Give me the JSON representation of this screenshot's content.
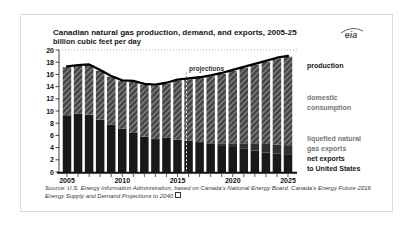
{
  "header": {
    "title": "Canadian natural gas production, demand, and exports, 2005-25",
    "subtitle": "billion cubic feet per day",
    "logo_text": "eia"
  },
  "colors": {
    "bar_net": "#191919",
    "bar_lng": "#303030",
    "hatch_base": "#464646",
    "hatch_stripe": "#8f8f8f",
    "production_line": "#000000",
    "axis": "#111111",
    "grid": "#999999",
    "muted_label": "#767676",
    "projection_dash_upper": "#888888",
    "projection_dash_lower": "#ffffff"
  },
  "chart_data": {
    "type": "bar",
    "title": "Canadian natural gas production, demand, and exports, 2005-25",
    "unit_label": "billion cubic feet per day",
    "x": [
      2005,
      2006,
      2007,
      2008,
      2009,
      2010,
      2011,
      2012,
      2013,
      2014,
      2015,
      2016,
      2017,
      2018,
      2019,
      2020,
      2021,
      2022,
      2023,
      2024,
      2025
    ],
    "xticks": [
      2005,
      2010,
      2015,
      2020,
      2025
    ],
    "ylim": [
      0,
      20
    ],
    "ytick_step": 2,
    "grid": "top-dotted-only",
    "projections_label": "projections",
    "projection_divider_after": 2015,
    "series": [
      {
        "name": "net exports to United States",
        "type": "bar",
        "stack": true,
        "color_key": "bar_net",
        "values": [
          9.3,
          9.6,
          9.4,
          8.6,
          7.8,
          7.1,
          6.4,
          5.8,
          5.4,
          5.6,
          5.3,
          5.1,
          4.9,
          4.7,
          4.4,
          4.1,
          3.8,
          3.5,
          3.2,
          3.0,
          2.8
        ]
      },
      {
        "name": "liquefied natural gas exports",
        "type": "bar",
        "stack": true,
        "color_key": "bar_lng",
        "values": [
          0,
          0,
          0,
          0,
          0,
          0,
          0,
          0,
          0,
          0,
          0,
          0,
          0,
          0,
          0.3,
          0.6,
          0.9,
          1.2,
          1.4,
          1.5,
          1.6
        ]
      },
      {
        "name": "domestic consumption",
        "type": "bar",
        "stack": true,
        "color_key": "hatch",
        "values": [
          7.9,
          7.8,
          8.1,
          8.0,
          7.8,
          7.8,
          8.4,
          8.5,
          8.8,
          8.9,
          9.7,
          10.1,
          10.5,
          11.0,
          11.4,
          11.9,
          12.4,
          12.9,
          13.5,
          14.1,
          14.5
        ]
      },
      {
        "name": "production",
        "type": "line",
        "color_key": "production_line",
        "values": [
          17.2,
          17.4,
          17.5,
          16.6,
          15.6,
          14.9,
          14.8,
          14.3,
          14.2,
          14.5,
          15.0,
          15.2,
          15.4,
          15.7,
          16.1,
          16.6,
          17.1,
          17.6,
          18.1,
          18.6,
          18.9
        ]
      }
    ],
    "legend_position": "right-annotations"
  },
  "annotations": [
    {
      "lines": [
        "production"
      ],
      "muted": false
    },
    {
      "lines": [
        "domestic",
        "consumption"
      ],
      "muted": true
    },
    {
      "lines": [
        "liquefied natural",
        "gas exports"
      ],
      "muted": true
    },
    {
      "lines": [
        "net exports",
        "to United States"
      ],
      "muted": false
    }
  ],
  "source": {
    "line1": "Source: U.S. Energy Information Administration, based on Canada's National Energy Board, Canada's Energy Future 2016",
    "line2": "Energy Supply and Demand Projections to 2040",
    "has_external_link_icon": true
  }
}
